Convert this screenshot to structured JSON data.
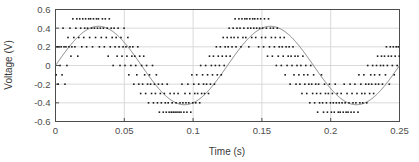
{
  "chart_data": {
    "type": "scatter",
    "title": "",
    "xlabel": "Time (s)",
    "ylabel": "Voltage (V)",
    "xlim": [
      0,
      0.25
    ],
    "ylim": [
      -0.6,
      0.6
    ],
    "xticks": [
      0,
      0.05,
      0.1,
      0.15,
      0.2,
      0.25
    ],
    "xticklabels": [
      "0",
      "0.05",
      "0.1",
      "0.15",
      "0.2",
      "0.25"
    ],
    "yticks": [
      -0.6,
      -0.4,
      -0.2,
      0,
      0.2,
      0.4,
      0.6
    ],
    "yticklabels": [
      "-0.6",
      "-0.4",
      "-0.2",
      "0",
      "0.2",
      "0.4",
      "0.6"
    ],
    "grid": "horizontal-and-vertical",
    "grid_color": "#d9d9d9",
    "frame_color": "#4d4d4d",
    "series": [
      {
        "name": "samples",
        "style": "scatter",
        "marker": "square",
        "marker_size": 1.6,
        "color": "#1a1a1a",
        "note": "noisy quantized samples of the sine, spread about the fitted curve",
        "x": [
          0.0005,
          0.0012,
          0.0019,
          0.0026,
          0.0033,
          0.0041,
          0.0048,
          0.0055,
          0.0062,
          0.0069,
          0.0076,
          0.0083,
          0.0091,
          0.0098,
          0.0105,
          0.0112,
          0.0119,
          0.0126,
          0.0133,
          0.0141,
          0.0148,
          0.0155,
          0.0162,
          0.0169,
          0.0176,
          0.0183,
          0.0191,
          0.0198,
          0.0205,
          0.0212,
          0.0219,
          0.0226,
          0.0233,
          0.0241,
          0.0248,
          0.0255,
          0.0262,
          0.0269,
          0.0276,
          0.0283,
          0.0291,
          0.0298,
          0.0305,
          0.0312,
          0.0319,
          0.0326,
          0.0333,
          0.0341,
          0.0348,
          0.0355,
          0.0362,
          0.0369,
          0.0376,
          0.0383,
          0.0391,
          0.0398,
          0.0405,
          0.0412,
          0.0419,
          0.0426,
          0.0433,
          0.0441,
          0.0448,
          0.0455,
          0.0462,
          0.0469,
          0.0476,
          0.0483,
          0.0491,
          0.0498,
          0.0505,
          0.0512,
          0.0519,
          0.0526,
          0.0533,
          0.0541,
          0.0548,
          0.0555,
          0.0562,
          0.0569,
          0.0576,
          0.0583,
          0.0591,
          0.0598,
          0.0605,
          0.0612,
          0.0619,
          0.0626,
          0.0633,
          0.0641,
          0.0648,
          0.0655,
          0.0662,
          0.0669,
          0.0676,
          0.0683,
          0.0691,
          0.0698,
          0.0705,
          0.0712,
          0.0719,
          0.0726,
          0.0733,
          0.0741,
          0.0748,
          0.0755,
          0.0762,
          0.0769,
          0.0776,
          0.0783,
          0.0791,
          0.0798,
          0.0805,
          0.0812,
          0.0819,
          0.0826,
          0.0833,
          0.0841,
          0.0848,
          0.0855,
          0.0862,
          0.0869,
          0.0876,
          0.0883,
          0.0891,
          0.0898,
          0.0905,
          0.0912,
          0.0919,
          0.0926,
          0.0933,
          0.0941,
          0.0948,
          0.0955,
          0.0962,
          0.0969,
          0.0976,
          0.0983,
          0.0991,
          0.0998,
          0.1005,
          0.1012,
          0.1019,
          0.1026,
          0.1033,
          0.1041,
          0.1048,
          0.1055,
          0.1062,
          0.1069,
          0.1076,
          0.1083,
          0.1091,
          0.1098,
          0.1105,
          0.1112,
          0.1119,
          0.1126,
          0.1133,
          0.1141,
          0.1148,
          0.1155,
          0.1162,
          0.1169,
          0.1176,
          0.1183,
          0.1191,
          0.1198,
          0.1205,
          0.1212,
          0.1219,
          0.1226,
          0.1233,
          0.1241,
          0.1248,
          0.1255,
          0.1262,
          0.1269,
          0.1276,
          0.1283,
          0.1291,
          0.1298,
          0.1305,
          0.1312,
          0.1319,
          0.1326,
          0.1333,
          0.1341,
          0.1348,
          0.1355,
          0.1362,
          0.1369,
          0.1376,
          0.1383,
          0.1391,
          0.1398,
          0.1405,
          0.1412,
          0.1419,
          0.1426,
          0.1433,
          0.1441,
          0.1448,
          0.1455,
          0.1462,
          0.1469,
          0.1476,
          0.1483,
          0.1491,
          0.1498,
          0.1505,
          0.1512,
          0.1519,
          0.1526,
          0.1533,
          0.1541,
          0.1548,
          0.1555,
          0.1562,
          0.1569,
          0.1576,
          0.1583,
          0.1591,
          0.1598,
          0.1605,
          0.1612,
          0.1619,
          0.1626,
          0.1633,
          0.1641,
          0.1648,
          0.1655,
          0.1662,
          0.1669,
          0.1676,
          0.1683,
          0.1691,
          0.1698,
          0.1705,
          0.1712,
          0.1719,
          0.1726,
          0.1733,
          0.1741,
          0.1748,
          0.1755,
          0.1762,
          0.1769,
          0.1776,
          0.1783,
          0.1791,
          0.1798,
          0.1805,
          0.1812,
          0.1819,
          0.1826,
          0.1833,
          0.1841,
          0.1848,
          0.1855,
          0.1862,
          0.1869,
          0.1876,
          0.1883,
          0.1891,
          0.1898,
          0.1905,
          0.1912,
          0.1919,
          0.1926,
          0.1933,
          0.1941,
          0.1948,
          0.1955,
          0.1962,
          0.1969,
          0.1976,
          0.1983,
          0.1991,
          0.1998,
          0.2005,
          0.2012,
          0.2019,
          0.2026,
          0.2033,
          0.2041,
          0.2048,
          0.2055,
          0.2062,
          0.2069,
          0.2076,
          0.2083,
          0.2091,
          0.2098,
          0.2105,
          0.2112,
          0.2119,
          0.2126,
          0.2133,
          0.2141,
          0.2148,
          0.2155,
          0.2162,
          0.2169,
          0.2176,
          0.2183,
          0.2191,
          0.2198,
          0.2205,
          0.2212,
          0.2219,
          0.2226,
          0.2233,
          0.2241,
          0.2248,
          0.2255,
          0.2262,
          0.2269,
          0.2276,
          0.2283,
          0.2291,
          0.2298,
          0.2305,
          0.2312,
          0.2319,
          0.2326,
          0.2333,
          0.2341,
          0.2348,
          0.2355,
          0.2362,
          0.2369,
          0.2376,
          0.2383,
          0.2391,
          0.2398,
          0.2405,
          0.2412,
          0.2419,
          0.2426,
          0.2433,
          0.2441,
          0.2448,
          0.2455,
          0.2462,
          0.2469,
          0.2476,
          0.2483,
          0.2491,
          0.2498
        ],
        "y": [
          -0.1,
          0.2,
          -0.2,
          0.2,
          0.0,
          0.2,
          -0.1,
          0.4,
          0.2,
          -0.2,
          0.2,
          0.0,
          0.3,
          0.2,
          0.4,
          0.1,
          0.2,
          0.5,
          0.3,
          0.2,
          0.4,
          0.5,
          0.1,
          0.3,
          0.5,
          0.4,
          0.2,
          0.5,
          0.3,
          0.4,
          0.5,
          0.2,
          0.4,
          0.5,
          0.3,
          0.5,
          0.4,
          0.2,
          0.5,
          0.4,
          0.3,
          0.5,
          0.4,
          0.5,
          0.2,
          0.4,
          0.3,
          0.5,
          0.4,
          0.2,
          0.5,
          0.3,
          0.4,
          0.1,
          0.5,
          0.2,
          0.4,
          0.3,
          0.0,
          0.4,
          0.2,
          0.3,
          0.1,
          0.4,
          0.2,
          0.0,
          0.3,
          0.1,
          0.2,
          0.4,
          0.0,
          0.2,
          0.1,
          0.3,
          -0.1,
          0.2,
          0.0,
          0.1,
          0.2,
          -0.2,
          0.1,
          0.0,
          -0.1,
          0.2,
          -0.2,
          0.1,
          -0.3,
          0.0,
          -0.2,
          0.1,
          -0.1,
          -0.3,
          0.0,
          -0.2,
          -0.4,
          -0.1,
          -0.2,
          -0.3,
          0.0,
          -0.4,
          -0.2,
          -0.3,
          -0.1,
          -0.4,
          -0.2,
          -0.5,
          -0.3,
          -0.4,
          -0.2,
          -0.5,
          -0.3,
          -0.4,
          -0.5,
          -0.2,
          -0.4,
          -0.5,
          -0.3,
          -0.5,
          -0.4,
          -0.5,
          -0.3,
          -0.5,
          -0.4,
          -0.5,
          -0.3,
          -0.5,
          -0.4,
          -0.5,
          -0.2,
          -0.4,
          -0.5,
          -0.3,
          -0.4,
          -0.5,
          -0.2,
          -0.4,
          -0.3,
          -0.5,
          -0.1,
          -0.4,
          -0.2,
          -0.3,
          -0.4,
          -0.1,
          -0.3,
          -0.2,
          -0.4,
          0.0,
          -0.3,
          -0.1,
          -0.2,
          -0.3,
          0.0,
          -0.2,
          -0.1,
          -0.3,
          0.1,
          -0.2,
          0.0,
          -0.1,
          0.1,
          -0.2,
          0.0,
          0.2,
          -0.1,
          0.1,
          0.0,
          0.2,
          -0.1,
          0.1,
          0.3,
          0.0,
          0.2,
          0.1,
          0.3,
          0.2,
          0.4,
          0.1,
          0.3,
          0.2,
          0.4,
          0.3,
          0.5,
          0.2,
          0.4,
          0.3,
          0.5,
          0.4,
          0.2,
          0.5,
          0.3,
          0.4,
          0.5,
          0.3,
          0.5,
          0.4,
          0.2,
          0.5,
          0.4,
          0.3,
          0.5,
          0.4,
          0.5,
          0.3,
          0.4,
          0.5,
          0.2,
          0.4,
          0.5,
          0.3,
          0.4,
          0.2,
          0.5,
          0.3,
          0.4,
          0.1,
          0.5,
          0.2,
          0.4,
          0.3,
          0.1,
          0.4,
          0.2,
          0.3,
          0.0,
          0.4,
          0.1,
          0.2,
          0.3,
          0.0,
          0.2,
          0.1,
          0.3,
          -0.1,
          0.2,
          0.0,
          0.1,
          0.2,
          -0.2,
          0.1,
          0.0,
          0.2,
          -0.1,
          0.1,
          -0.2,
          0.0,
          0.1,
          -0.1,
          -0.2,
          0.0,
          -0.3,
          0.1,
          -0.1,
          -0.2,
          0.0,
          -0.3,
          -0.1,
          -0.2,
          -0.4,
          0.0,
          -0.2,
          -0.3,
          -0.1,
          -0.4,
          -0.2,
          -0.3,
          -0.5,
          -0.2,
          -0.4,
          -0.3,
          -0.1,
          -0.4,
          -0.5,
          -0.2,
          -0.3,
          -0.4,
          -0.5,
          -0.3,
          -0.2,
          -0.4,
          -0.5,
          -0.3,
          -0.4,
          -0.5,
          -0.2,
          -0.4,
          -0.3,
          -0.5,
          -0.4,
          -0.5,
          -0.3,
          -0.4,
          -0.5,
          -0.2,
          -0.4,
          -0.5,
          -0.3,
          -0.5,
          -0.4,
          -0.2,
          -0.5,
          -0.3,
          -0.4,
          -0.5,
          -0.2,
          -0.4,
          -0.3,
          -0.5,
          -0.1,
          -0.4,
          -0.2,
          -0.3,
          -0.4,
          -0.1,
          -0.3,
          -0.2,
          -0.4,
          0.0,
          -0.2,
          -0.3,
          -0.1,
          -0.2,
          0.0,
          -0.3,
          -0.1,
          -0.2,
          0.0,
          0.1,
          -0.2,
          -0.1,
          0.0,
          0.1,
          -0.2,
          0.0,
          0.1,
          -0.1,
          0.2,
          0.0,
          0.1,
          -0.2,
          0.2,
          0.1,
          0.0,
          0.2,
          -0.1,
          0.1,
          0.2,
          0.0,
          0.2,
          0.1
        ]
      },
      {
        "name": "fitted-sine",
        "style": "line",
        "color": "#7f7f7f",
        "line_width": 1,
        "amplitude": 0.42,
        "frequency_hz": 8.0,
        "phase_rad": 0.0,
        "offset": 0.0
      }
    ]
  },
  "axes": {
    "xlabel": "Time (s)",
    "ylabel": "Voltage (V)"
  }
}
